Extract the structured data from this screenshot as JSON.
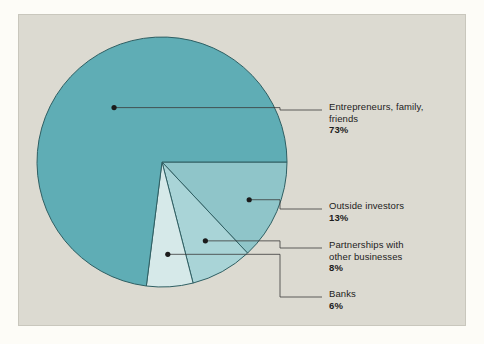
{
  "figure": {
    "panel_background": "#dcdad1",
    "page_background": "#fdfcf7",
    "outline_color": "#2f5f63"
  },
  "chart_data": {
    "type": "pie",
    "title": "",
    "subtitle": "",
    "xlabel": "",
    "ylabel": "",
    "legend_position": "callout-labels-right",
    "grid": false,
    "total": 100,
    "unit": "%",
    "categories": [
      "Entrepreneurs, family, friends",
      "Outside investors",
      "Partnerships with other businesses",
      "Banks"
    ],
    "values": [
      73,
      13,
      8,
      6
    ],
    "colors": [
      "#5fadb5",
      "#8fc5c9",
      "#a9d4d7",
      "#d6e9e9"
    ],
    "slices": [
      {
        "id": "entrepreneurs",
        "label_line1": "Entrepreneurs, family,",
        "label_line2": "friends",
        "percent_label": "73%",
        "value": 73,
        "color": "#5fadb5"
      },
      {
        "id": "outside-investors",
        "label_line1": "Outside investors",
        "label_line2": "",
        "percent_label": "13%",
        "value": 13,
        "color": "#8fc5c9"
      },
      {
        "id": "partnerships",
        "label_line1": "Partnerships with",
        "label_line2": "other businesses",
        "percent_label": "8%",
        "value": 8,
        "color": "#a9d4d7"
      },
      {
        "id": "banks",
        "label_line1": "Banks",
        "label_line2": "",
        "percent_label": "6%",
        "value": 6,
        "color": "#d6e9e9"
      }
    ],
    "geometry": {
      "center_x": 162,
      "center_y": 162,
      "radius": 125,
      "start_angle_deg": 0
    }
  }
}
